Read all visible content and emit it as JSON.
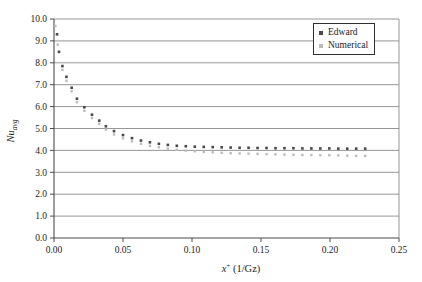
{
  "chart_data": {
    "type": "scatter",
    "title": "",
    "xlabel": {
      "var": "x",
      "sup": "+",
      "rest": " (1/Gz)"
    },
    "ylabel": {
      "var": "Nu",
      "sub": "avg"
    },
    "xlim": [
      0,
      0.25
    ],
    "ylim": [
      0,
      10
    ],
    "grid": {
      "horizontal": true,
      "vertical": false,
      "color": "#8a8a8a"
    },
    "frame": {
      "top": true,
      "right": true,
      "color": "#8a8a8a"
    },
    "axis_color": "#4d4d4d",
    "text_color": "#1c1c1c",
    "x_ticks": [
      {
        "value": 0.0,
        "label": "0.00"
      },
      {
        "value": 0.05,
        "label": "0.05"
      },
      {
        "value": 0.1,
        "label": "0.10"
      },
      {
        "value": 0.15,
        "label": "0.15"
      },
      {
        "value": 0.2,
        "label": "0.20"
      },
      {
        "value": 0.25,
        "label": "0.25"
      }
    ],
    "y_ticks": [
      {
        "value": 0,
        "label": "0.0"
      },
      {
        "value": 1,
        "label": "1.0"
      },
      {
        "value": 2,
        "label": "2.0"
      },
      {
        "value": 3,
        "label": "3.0"
      },
      {
        "value": 4,
        "label": "4.0"
      },
      {
        "value": 5,
        "label": "5.0"
      },
      {
        "value": 6,
        "label": "6.0"
      },
      {
        "value": 7,
        "label": "7.0"
      },
      {
        "value": 8,
        "label": "8.0"
      },
      {
        "value": 9,
        "label": "9.0"
      },
      {
        "value": 10,
        "label": "10.0"
      }
    ],
    "legend": {
      "position": "top-right"
    },
    "series": [
      {
        "name": "Edward",
        "color": "#484848",
        "marker": "square",
        "marker_size": 2.6,
        "points": [
          [
            0.0022,
            9.3
          ],
          [
            0.0036,
            8.5
          ],
          [
            0.0061,
            7.85
          ],
          [
            0.009,
            7.36
          ],
          [
            0.0128,
            6.86
          ],
          [
            0.0166,
            6.36
          ],
          [
            0.022,
            5.97
          ],
          [
            0.0275,
            5.63
          ],
          [
            0.0328,
            5.36
          ],
          [
            0.0376,
            5.1
          ],
          [
            0.0435,
            4.88
          ],
          [
            0.05,
            4.7
          ],
          [
            0.0565,
            4.56
          ],
          [
            0.063,
            4.45
          ],
          [
            0.0695,
            4.37
          ],
          [
            0.076,
            4.3
          ],
          [
            0.0825,
            4.25
          ],
          [
            0.089,
            4.21
          ],
          [
            0.0955,
            4.19
          ],
          [
            0.102,
            4.17
          ],
          [
            0.1085,
            4.16
          ],
          [
            0.115,
            4.15
          ],
          [
            0.1215,
            4.14
          ],
          [
            0.128,
            4.13
          ],
          [
            0.1345,
            4.12
          ],
          [
            0.141,
            4.12
          ],
          [
            0.1475,
            4.11
          ],
          [
            0.154,
            4.11
          ],
          [
            0.1605,
            4.1
          ],
          [
            0.167,
            4.1
          ],
          [
            0.1735,
            4.1
          ],
          [
            0.18,
            4.09
          ],
          [
            0.1865,
            4.09
          ],
          [
            0.193,
            4.09
          ],
          [
            0.1995,
            4.09
          ],
          [
            0.206,
            4.08
          ],
          [
            0.2125,
            4.08
          ],
          [
            0.219,
            4.08
          ],
          [
            0.2255,
            4.08
          ]
        ]
      },
      {
        "name": "Numerical",
        "color": "#bcbcbc",
        "marker": "square",
        "marker_size": 2.4,
        "points": [
          [
            0.001,
            9.68
          ],
          [
            0.0027,
            8.83
          ],
          [
            0.0061,
            7.68
          ],
          [
            0.009,
            7.18
          ],
          [
            0.0128,
            6.7
          ],
          [
            0.0166,
            6.2
          ],
          [
            0.022,
            5.81
          ],
          [
            0.0275,
            5.48
          ],
          [
            0.0328,
            5.21
          ],
          [
            0.0376,
            4.95
          ],
          [
            0.0435,
            4.73
          ],
          [
            0.05,
            4.55
          ],
          [
            0.0565,
            4.41
          ],
          [
            0.063,
            4.3
          ],
          [
            0.0695,
            4.21
          ],
          [
            0.076,
            4.14
          ],
          [
            0.0825,
            4.08
          ],
          [
            0.089,
            4.03
          ],
          [
            0.0955,
            3.99
          ],
          [
            0.102,
            3.96
          ],
          [
            0.1085,
            3.93
          ],
          [
            0.115,
            3.91
          ],
          [
            0.1215,
            3.89
          ],
          [
            0.128,
            3.87
          ],
          [
            0.1345,
            3.86
          ],
          [
            0.141,
            3.85
          ],
          [
            0.1475,
            3.84
          ],
          [
            0.154,
            3.83
          ],
          [
            0.1605,
            3.82
          ],
          [
            0.167,
            3.81
          ],
          [
            0.1735,
            3.8
          ],
          [
            0.18,
            3.79
          ],
          [
            0.1865,
            3.79
          ],
          [
            0.193,
            3.78
          ],
          [
            0.1995,
            3.78
          ],
          [
            0.206,
            3.77
          ],
          [
            0.2125,
            3.76
          ],
          [
            0.219,
            3.75
          ],
          [
            0.2255,
            3.75
          ]
        ]
      }
    ]
  }
}
